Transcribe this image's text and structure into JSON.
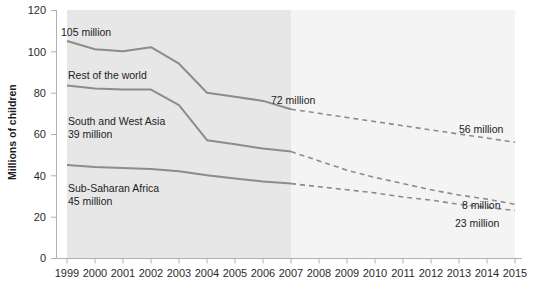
{
  "chart_data": {
    "type": "area",
    "title": "",
    "xlabel": "",
    "ylabel": "Millions of children",
    "ylim": [
      0,
      120
    ],
    "yticks": [
      0,
      20,
      40,
      60,
      80,
      100,
      120
    ],
    "grid": false,
    "legend_position": "inline-annotations",
    "x": [
      1999,
      2000,
      2001,
      2002,
      2003,
      2004,
      2005,
      2006,
      2007,
      2008,
      2009,
      2010,
      2011,
      2012,
      2013,
      2014,
      2015
    ],
    "xticklabels": [
      "1999",
      "2000",
      "2001",
      "2002",
      "2003",
      "2004",
      "2005",
      "2006",
      "2007",
      "2008",
      "2009",
      "2010",
      "2011",
      "2012",
      "2013",
      "2014",
      "2015"
    ],
    "observed_range": [
      1999,
      2007
    ],
    "projected_range": [
      2007,
      2015
    ],
    "stacking": "cumulative-top-lines",
    "series": [
      {
        "name": "Sub-Saharan Africa",
        "kind": "cumulative-boundary",
        "values": [
          45,
          44,
          43.5,
          43,
          42,
          40,
          38.5,
          37,
          36,
          34.5,
          33,
          31.5,
          29.5,
          28,
          26,
          24.5,
          23
        ]
      },
      {
        "name": "South and West Asia",
        "kind": "cumulative-boundary",
        "values": [
          83.5,
          82,
          81.5,
          81.5,
          74,
          57,
          55,
          53,
          51.5,
          47,
          42.5,
          39,
          36,
          33,
          30.5,
          28.5,
          26
        ]
      },
      {
        "name": "Rest of the world",
        "kind": "cumulative-boundary",
        "values": [
          105,
          101,
          100,
          102,
          94,
          80,
          78,
          76,
          72,
          70,
          68,
          66,
          64,
          62,
          60,
          58,
          56
        ]
      }
    ],
    "band_labels": [
      {
        "text": "Rest of the world",
        "value": null
      },
      {
        "text": "South and West Asia",
        "value": "39 million"
      },
      {
        "text": "Sub-Saharan Africa",
        "value": "45 million"
      }
    ],
    "annotations": [
      {
        "id": "start-total",
        "text": "105 million",
        "x": 1999,
        "y": 105
      },
      {
        "id": "mid-total",
        "text": "72 million",
        "x": 2007,
        "y": 72
      },
      {
        "id": "end-total",
        "text": "56 million",
        "x": 2015,
        "y": 56
      },
      {
        "id": "end-swasia",
        "text": "8 million",
        "x": 2015,
        "y": 26
      },
      {
        "id": "end-africa",
        "text": "23 million",
        "x": 2015,
        "y": 23
      }
    ],
    "colors": {
      "line": "#8c8c8c",
      "observed_fill": "#e7e7e7",
      "projected_fill": "#f4f4f4",
      "axis": "#b0b0b0",
      "text": "#1c1c1c"
    }
  }
}
